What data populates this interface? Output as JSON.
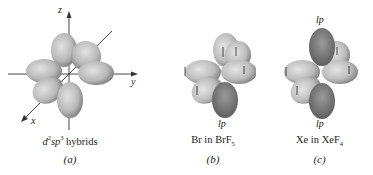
{
  "figure": {
    "panels": [
      {
        "id": "a",
        "caption_base": "d",
        "caption_sup1": "2",
        "caption_mid": "sp",
        "caption_sup2": "3",
        "caption_tail": " hybrids",
        "label": "(a)",
        "axes": {
          "z": "z",
          "y": "y",
          "x": "x"
        }
      },
      {
        "id": "b",
        "caption_main": "Br in BrF",
        "caption_sub": "5",
        "label": "(b)",
        "lone_pair_label": "lp"
      },
      {
        "id": "c",
        "caption_main": "Xe in XeF",
        "caption_sub": "4",
        "label": "(c)",
        "lone_pair_top_label": "lp",
        "lone_pair_bottom_label": "lp"
      }
    ],
    "colors": {
      "lobe_light": "#d4d4d4",
      "lobe_dark": "#7a7a7a",
      "lone_pair_dark": "#6a6a6a",
      "axis": "#333333"
    }
  }
}
